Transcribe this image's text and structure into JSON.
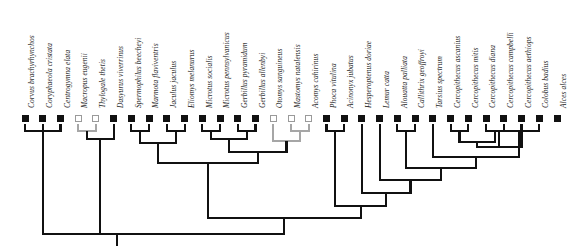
{
  "figure": {
    "type": "phylogenetic-cladogram",
    "orientation": "tips-at-top-root-at-bottom",
    "taxa_count": 29,
    "tip_marker_states": {
      "filled": "black square state",
      "open": "white square state"
    }
  },
  "taxa": [
    {
      "i": 0,
      "name": "Corvus brachyrhynchos",
      "state": "filled"
    },
    {
      "i": 1,
      "name": "Coryphaeola cristata",
      "state": "filled"
    },
    {
      "i": 2,
      "name": "Centrogymna elata",
      "state": "filled"
    },
    {
      "i": 3,
      "name": "Macropus eugenii",
      "state": "open"
    },
    {
      "i": 4,
      "name": "Thylogale thetis",
      "state": "open"
    },
    {
      "i": 5,
      "name": "Dasyurus viverrinus",
      "state": "filled"
    },
    {
      "i": 6,
      "name": "Spermophilus beecheyi",
      "state": "filled"
    },
    {
      "i": 7,
      "name": "Marmota flaviventris",
      "state": "filled"
    },
    {
      "i": 8,
      "name": "Jaculus jaculus",
      "state": "filled"
    },
    {
      "i": 9,
      "name": "Eliomys melanurus",
      "state": "filled"
    },
    {
      "i": 10,
      "name": "Microtus socialis",
      "state": "filled"
    },
    {
      "i": 11,
      "name": "Microtus pennsylvanicus",
      "state": "filled"
    },
    {
      "i": 12,
      "name": "Gerbillus pyramidum",
      "state": "filled"
    },
    {
      "i": 13,
      "name": "Gerbillus allenbyi",
      "state": "filled"
    },
    {
      "i": 14,
      "name": "Otomys sanguineus",
      "state": "open"
    },
    {
      "i": 15,
      "name": "Mastomys natalensis",
      "state": "open"
    },
    {
      "i": 16,
      "name": "Acomys cahirinus",
      "state": "open"
    },
    {
      "i": 17,
      "name": "Phoca vitulina",
      "state": "filled"
    },
    {
      "i": 18,
      "name": "Acinonyx jubatus",
      "state": "filled"
    },
    {
      "i": 19,
      "name": "Hesperoptenus doriae",
      "state": "filled"
    },
    {
      "i": 20,
      "name": "Lemur catta",
      "state": "filled"
    },
    {
      "i": 21,
      "name": "Alouatta palliata",
      "state": "filled"
    },
    {
      "i": 22,
      "name": "Callithrix geoffroyi",
      "state": "filled"
    },
    {
      "i": 23,
      "name": "Tarsius spectrum",
      "state": "filled"
    },
    {
      "i": 24,
      "name": "Cercopithecus ascanius",
      "state": "filled"
    },
    {
      "i": 25,
      "name": "Cercopithecus mitis",
      "state": "filled"
    },
    {
      "i": 26,
      "name": "Cercopithecus diana",
      "state": "filled"
    },
    {
      "i": 27,
      "name": "Cercopithecus campbelli",
      "state": "filled"
    },
    {
      "i": 28,
      "name": "Cercopithecus aethiops",
      "state": "filled"
    },
    {
      "i": 29,
      "name": "Colobus badius",
      "state": "filled"
    },
    {
      "i": 30,
      "name": "Alces alces",
      "state": "filled"
    }
  ],
  "geometry": {
    "tip_x_start": 25,
    "tip_x_step": 18.2,
    "tip_marker_y": 115,
    "label_baseline_y": 108,
    "root_y": 234,
    "root_stub_x": 117
  },
  "colors": {
    "branch_black": "#111111",
    "branch_gray": "#a6a6a6",
    "marker_fill": "#111111",
    "marker_open_border": "#9a9a9a",
    "background": "#ffffff"
  },
  "clades": [
    {
      "name": "corvus-coryphaeola-centrogymna",
      "children": [
        0,
        1,
        2
      ],
      "y": 131,
      "color": "black"
    },
    {
      "name": "macropus-thylogale",
      "children": [
        3,
        4
      ],
      "y": 131,
      "color": "gray"
    },
    {
      "name": "marsupials",
      "children": [
        "macropus-thylogale",
        5
      ],
      "y": 139,
      "color": "black"
    },
    {
      "name": "spermophilus-marmota",
      "children": [
        6,
        7
      ],
      "y": 131,
      "color": "black"
    },
    {
      "name": "jaculus-eliomys",
      "children": [
        8,
        9
      ],
      "y": 131,
      "color": "black"
    },
    {
      "name": "sciurid-glirid",
      "children": [
        "spermophilus-marmota",
        "jaculus-eliomys"
      ],
      "y": 143,
      "color": "black"
    },
    {
      "name": "microtus-pair",
      "children": [
        10,
        11
      ],
      "y": 131,
      "color": "black"
    },
    {
      "name": "gerbillus-pair",
      "children": [
        12,
        13
      ],
      "y": 131,
      "color": "black"
    },
    {
      "name": "murid-core",
      "children": [
        "microtus-pair",
        "gerbillus-pair"
      ],
      "y": 139,
      "color": "black"
    },
    {
      "name": "mastomys-acomys",
      "children": [
        15,
        16
      ],
      "y": 131,
      "color": "gray"
    },
    {
      "name": "otomys-group",
      "children": [
        14,
        "mastomys-acomys"
      ],
      "y": 141,
      "color": "gray"
    },
    {
      "name": "muroidea",
      "children": [
        "murid-core",
        "otomys-group"
      ],
      "y": 152,
      "color": "black"
    },
    {
      "name": "rodentia",
      "children": [
        "sciurid-glirid",
        "muroidea"
      ],
      "y": 163,
      "color": "black"
    },
    {
      "name": "phoca-acinonyx",
      "children": [
        17,
        18
      ],
      "y": 131,
      "color": "black"
    },
    {
      "name": "cercopithecus-am",
      "children": [
        24,
        25
      ],
      "y": 131,
      "color": "black"
    },
    {
      "name": "cercopithecus-dc",
      "children": [
        26,
        27
      ],
      "y": 131,
      "color": "black"
    },
    {
      "name": "cercopithecus-4",
      "children": [
        "cercopithecus-am",
        "cercopithecus-dc"
      ],
      "y": 142,
      "color": "black"
    },
    {
      "name": "cercopithecus-5",
      "children": [
        "cercopithecus-4",
        28
      ],
      "y": 147,
      "color": "black"
    },
    {
      "name": "cercopithecini",
      "children": [
        "cercopithecus-5",
        29
      ],
      "y": 131,
      "color": "black"
    },
    {
      "name": "catarrhini",
      "children": [
        "cercopithecini",
        23
      ],
      "y": 157,
      "color": "black"
    },
    {
      "name": "alouatta-callithrix",
      "children": [
        21,
        22
      ],
      "y": 131,
      "color": "black"
    },
    {
      "name": "anthropoidea",
      "children": [
        "catarrhini",
        "alouatta-callithrix"
      ],
      "y": 168,
      "color": "black"
    },
    {
      "name": "primates-haplo",
      "children": [
        "anthropoidea",
        20
      ],
      "y": 180,
      "color": "black"
    },
    {
      "name": "primates",
      "children": [
        "primates-haplo",
        19
      ],
      "y": 193,
      "color": "black"
    },
    {
      "name": "laurasiatheria-primates",
      "children": [
        "primates",
        "phoca-acinonyx"
      ],
      "y": 206,
      "color": "black"
    },
    {
      "name": "placentalia",
      "children": [
        "rodentia",
        "laurasiatheria-primates"
      ],
      "y": 218,
      "color": "black"
    },
    {
      "name": "amniota-root",
      "children": [
        "corvus-coryphaeola-centrogymna",
        "marsupials",
        "placentalia"
      ],
      "y": 234,
      "color": "black"
    }
  ]
}
